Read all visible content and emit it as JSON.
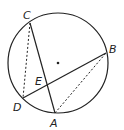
{
  "diagram": {
    "type": "circle-geometry",
    "circle": {
      "cx": 58,
      "cy": 63,
      "r": 50,
      "center_marked": true
    },
    "points": [
      {
        "name": "A",
        "x": 55,
        "y": 113,
        "label_x": 50,
        "label_y": 127
      },
      {
        "name": "B",
        "x": 106,
        "y": 53,
        "label_x": 109,
        "label_y": 53
      },
      {
        "name": "C",
        "x": 30,
        "y": 23,
        "label_x": 23,
        "label_y": 19
      },
      {
        "name": "D",
        "x": 23,
        "y": 98,
        "label_x": 13,
        "label_y": 111
      },
      {
        "name": "E",
        "x": 48,
        "y": 84,
        "label_x": 35,
        "label_y": 85
      }
    ],
    "segments": [
      {
        "from": "C",
        "to": "A",
        "style": "solid"
      },
      {
        "from": "D",
        "to": "B",
        "style": "solid"
      },
      {
        "from": "C",
        "to": "D",
        "style": "dashed"
      },
      {
        "from": "A",
        "to": "B",
        "style": "dashed"
      }
    ],
    "stroke_color": "#222222"
  }
}
